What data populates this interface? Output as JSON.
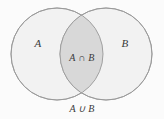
{
  "diagram": {
    "type": "venn-two-set",
    "background_color": "#fbfbfb",
    "circle_fill_color": "#f2f2f2",
    "intersection_fill_color": "#d8d8d8",
    "stroke_color": "#999999",
    "text_color": "#3a3a3a",
    "sets": [
      {
        "id": "A",
        "label": "A",
        "cx": 57,
        "cy": 54,
        "r": 46
      },
      {
        "id": "B",
        "label": "B",
        "cx": 106,
        "cy": 54,
        "r": 46
      }
    ],
    "intersection": {
      "label": "A ∩ B",
      "symbol_name": "intersection-symbol"
    },
    "caption": {
      "label": "A ∪ B",
      "symbol_name": "union-symbol"
    }
  }
}
